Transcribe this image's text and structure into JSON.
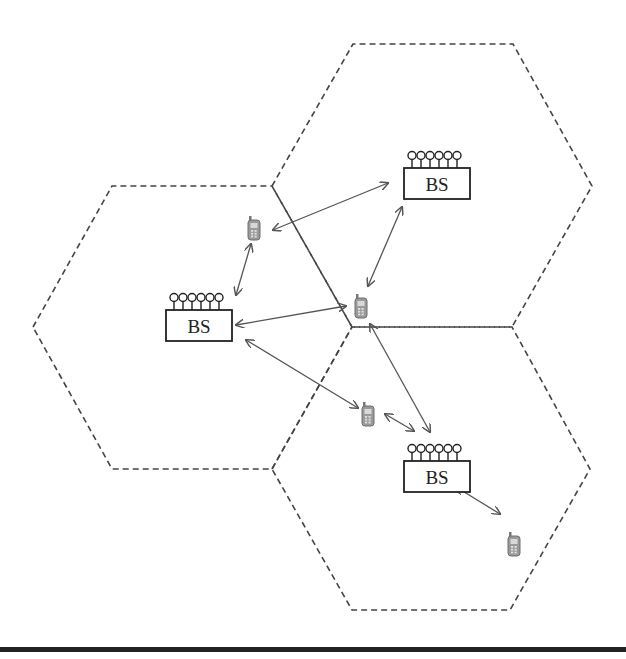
{
  "diagram": {
    "colors": {
      "cell_border": "#444444",
      "arrow": "#555555",
      "bs_stroke": "#222222",
      "phone_fill": "#9a9a9a",
      "bottom_bar": "#222222"
    },
    "cells": [
      {
        "id": "cell-left",
        "points": "33,327 112,186 272,186 352,327 272,469 112,469"
      },
      {
        "id": "cell-top-right",
        "points": "272,186 353,44 513,44 592,186 512,327 352,327"
      },
      {
        "id": "cell-bottom-right",
        "points": "272,469 352,327 512,327 590,469 510,610 352,610"
      }
    ],
    "base_stations": [
      {
        "id": "bs-left",
        "label": "BS",
        "x": 166,
        "y": 293
      },
      {
        "id": "bs-top-right",
        "label": "BS",
        "x": 404,
        "y": 151
      },
      {
        "id": "bs-bottom-right",
        "label": "BS",
        "x": 404,
        "y": 444
      }
    ],
    "phones": [
      {
        "id": "phone-1",
        "x": 248,
        "y": 216
      },
      {
        "id": "phone-2",
        "x": 355,
        "y": 294
      },
      {
        "id": "phone-3",
        "x": 362,
        "y": 402
      },
      {
        "id": "phone-4",
        "x": 508,
        "y": 532
      }
    ],
    "links": [
      {
        "id": "link-1",
        "x1": 273,
        "y1": 230,
        "x2": 388,
        "y2": 183
      },
      {
        "id": "link-2",
        "x1": 251,
        "y1": 244,
        "x2": 236,
        "y2": 295
      },
      {
        "id": "link-3",
        "x1": 368,
        "y1": 286,
        "x2": 402,
        "y2": 207
      },
      {
        "id": "link-4",
        "x1": 236,
        "y1": 325,
        "x2": 346,
        "y2": 306
      },
      {
        "id": "link-5",
        "x1": 246,
        "y1": 340,
        "x2": 358,
        "y2": 408
      },
      {
        "id": "link-6",
        "x1": 370,
        "y1": 324,
        "x2": 430,
        "y2": 432
      },
      {
        "id": "link-7",
        "x1": 385,
        "y1": 414,
        "x2": 414,
        "y2": 431
      },
      {
        "id": "link-8",
        "x1": 456,
        "y1": 487,
        "x2": 500,
        "y2": 514
      }
    ]
  }
}
